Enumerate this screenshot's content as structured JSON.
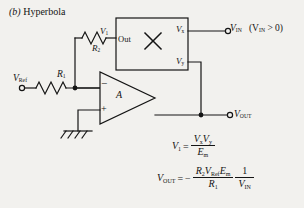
{
  "figure": {
    "caption_index": "(b)",
    "caption_title": "Hyperbola"
  },
  "circuit": {
    "multiplier": {
      "input_label": "Out",
      "symbol": "×",
      "x_input_label": "V",
      "x_input_sub": "x",
      "y_input_label": "V",
      "y_input_sub": "y"
    },
    "opamp": {
      "gain_label": "A",
      "inverting_sign": "−",
      "noninverting_sign": "+"
    },
    "resistors": [
      {
        "name": "R",
        "sub": "2",
        "position": "feedback"
      },
      {
        "name": "R",
        "sub": "1",
        "position": "input"
      }
    ],
    "nodes": {
      "v1_label": "V",
      "v1_sub": "1",
      "vref_label": "V",
      "vref_sub": "Ref",
      "vin_label": "V",
      "vin_sub": "IN",
      "vin_condition": "(V",
      "vin_condition_sub": "IN",
      "vin_condition_rest": " > 0)",
      "vout_label": "V",
      "vout_sub": "OUT"
    },
    "ground": "earth-ground"
  },
  "equations": {
    "eq1": {
      "lhs": "V",
      "lhs_sub": "1",
      "equals": "=",
      "numerator": "V",
      "numerator_sub1": "x",
      "numerator2": "V",
      "numerator_sub2": "y",
      "denominator": "E",
      "denominator_sub": "m"
    },
    "eq2": {
      "lhs": "V",
      "lhs_sub": "OUT",
      "equals": "=",
      "sign": "−",
      "num_r2": "R",
      "num_r2_sub": "2",
      "num_vref": "V",
      "num_vref_sub": "Ref",
      "num_em": "E",
      "num_em_sub": "m",
      "den_r1": "R",
      "den_r1_sub": "1",
      "frac2_num": "1",
      "frac2_den": "V",
      "frac2_den_sub": "IN"
    }
  },
  "colors": {
    "background": "#f2f1ee",
    "ink": "#141414"
  }
}
